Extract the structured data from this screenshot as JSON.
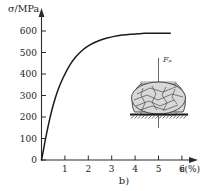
{
  "figure": {
    "caption": "b)"
  },
  "chart_data": {
    "type": "line",
    "title": "",
    "ylabel": "σ/MPa",
    "xlabel": "ε(%)",
    "xlim": [
      0,
      6.6
    ],
    "ylim": [
      0,
      640
    ],
    "grid": false,
    "legend": null,
    "y_ticks": [
      0,
      100,
      200,
      300,
      400,
      500,
      600
    ],
    "y_tick_labels": [
      "0",
      "100",
      "200",
      "300",
      "400",
      "500",
      "600"
    ],
    "x_ticks": [
      1,
      2,
      3,
      4,
      5,
      6
    ],
    "x_tick_labels": [
      "1",
      "2",
      "3",
      "4",
      "5",
      "6"
    ],
    "series": [
      {
        "name": "compression stress-strain curve",
        "x": [
          0.0,
          0.08,
          0.16,
          0.25,
          0.35,
          0.45,
          0.58,
          0.72,
          0.88,
          1.05,
          1.25,
          1.45,
          1.7,
          1.95,
          2.2,
          2.5,
          2.8,
          3.1,
          3.45,
          3.8,
          4.1,
          4.4,
          4.7,
          5.0,
          5.25,
          5.5
        ],
        "y": [
          0,
          45,
          92,
          140,
          190,
          235,
          285,
          330,
          372,
          410,
          448,
          478,
          506,
          527,
          543,
          557,
          567,
          575,
          581,
          585,
          587,
          589,
          590,
          590,
          590,
          589
        ]
      }
    ],
    "annotations": [
      {
        "name": "specimen-inset",
        "label": "Fₚ",
        "description": "compression specimen with shear cracks on hatched support"
      }
    ]
  },
  "inset": {
    "force_label": "Fₚ"
  }
}
